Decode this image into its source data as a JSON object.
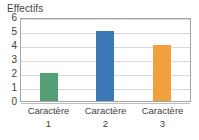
{
  "chart_data": {
    "type": "bar",
    "title": "Effectifs",
    "xlabel": "",
    "ylabel": "",
    "categories": [
      "Caractère 1",
      "Caractère 2",
      "Caractère 3"
    ],
    "category_names": [
      "Caractère",
      "Caractère",
      "Caractère"
    ],
    "category_numbers": [
      "1",
      "2",
      "3"
    ],
    "values": [
      2,
      5,
      4
    ],
    "colors": [
      "#54a076",
      "#3b78b5",
      "#f2a03c"
    ],
    "ylim": [
      0,
      6
    ],
    "yticks": [
      0,
      1,
      2,
      3,
      4,
      5,
      6
    ],
    "ytick_labels": [
      "0",
      "1",
      "2",
      "3",
      "4",
      "5",
      "6"
    ],
    "grid": true,
    "grid_axis": "y",
    "legend": false,
    "legend_position": "none",
    "bars": [
      {
        "category": "Caractère 1",
        "name": "Caractère",
        "number": "1",
        "value": 2,
        "color": "#54a076"
      },
      {
        "category": "Caractère 2",
        "name": "Caractère",
        "number": "2",
        "value": 5,
        "color": "#3b78b5"
      },
      {
        "category": "Caractère 3",
        "name": "Caractère",
        "number": "3",
        "value": 4,
        "color": "#f2a03c"
      }
    ]
  },
  "style": {
    "plot_border_color": "#a6a6a6",
    "gridline_color": "#d9d9d9",
    "text_color": "#3f3f3f",
    "background": "#ffffff"
  }
}
